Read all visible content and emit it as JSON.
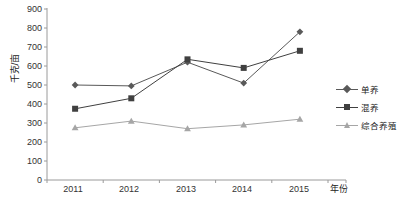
{
  "chart_data": {
    "type": "line",
    "title": "",
    "xlabel": "年份",
    "ylabel": "千克/亩",
    "categories": [
      "2011",
      "2012",
      "2013",
      "2014",
      "2015"
    ],
    "ylim": [
      0,
      900
    ],
    "yticks": [
      "0",
      "100",
      "200",
      "300",
      "400",
      "500",
      "600",
      "700",
      "800",
      "900"
    ],
    "grid": false,
    "legend_position": "right",
    "series": [
      {
        "name": "单养",
        "marker": "diamond",
        "color": "#595959",
        "values": [
          500,
          495,
          620,
          510,
          780
        ]
      },
      {
        "name": "混养",
        "marker": "square",
        "color": "#404040",
        "values": [
          375,
          430,
          635,
          590,
          680
        ]
      },
      {
        "name": "综合养殖",
        "marker": "triangle",
        "color": "#a6a6a6",
        "values": [
          275,
          310,
          270,
          290,
          320
        ]
      }
    ]
  },
  "axis": {
    "line_color": "#9a9a9a",
    "tick_color": "#9a9a9a"
  }
}
